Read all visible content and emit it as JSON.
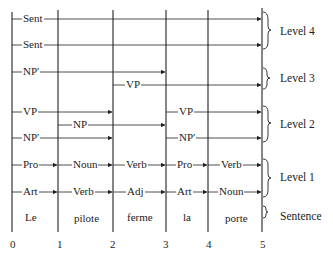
{
  "diagram": {
    "type": "parse chart / well-formed substring table",
    "node_positions": [
      "0",
      "1",
      "2",
      "3",
      "4",
      "5"
    ],
    "sentence_words": [
      "Le",
      "pilote",
      "ferme",
      "la",
      "porte"
    ],
    "levels": [
      {
        "name": "Level 4",
        "edges": [
          {
            "label": "Sent",
            "from": 0,
            "to": 5
          },
          {
            "label": "Sent",
            "from": 0,
            "to": 5
          }
        ]
      },
      {
        "name": "Level 3",
        "edges": [
          {
            "label": "NP′",
            "from": 0,
            "to": 3
          },
          {
            "label": "VP",
            "from": 2,
            "to": 5
          }
        ]
      },
      {
        "name": "Level 2",
        "edges": [
          {
            "label": "VP",
            "from": 0,
            "to": 2
          },
          {
            "label": "NP",
            "from": 1,
            "to": 3
          },
          {
            "label": "NP′",
            "from": 0,
            "to": 2
          },
          {
            "label": "VP",
            "from": 3,
            "to": 5
          },
          {
            "label": "NP′",
            "from": 3,
            "to": 5
          }
        ]
      },
      {
        "name": "Level 1",
        "edges": [
          {
            "label": "Pro",
            "from": 0,
            "to": 1
          },
          {
            "label": "Noun",
            "from": 1,
            "to": 2
          },
          {
            "label": "Verb",
            "from": 2,
            "to": 3
          },
          {
            "label": "Pro",
            "from": 3,
            "to": 4
          },
          {
            "label": "Verb",
            "from": 4,
            "to": 5
          },
          {
            "label": "Art",
            "from": 0,
            "to": 1
          },
          {
            "label": "Verb",
            "from": 1,
            "to": 2
          },
          {
            "label": "Adj",
            "from": 2,
            "to": 3
          },
          {
            "label": "Art",
            "from": 3,
            "to": 4
          },
          {
            "label": "Noun",
            "from": 4,
            "to": 5
          }
        ]
      },
      {
        "name": "Sentence"
      }
    ],
    "level_labels": [
      "Level 4",
      "Level 3",
      "Level 2",
      "Level 1",
      "Sentence"
    ]
  }
}
